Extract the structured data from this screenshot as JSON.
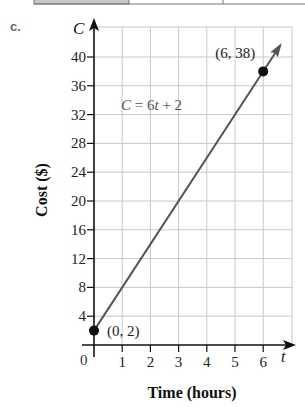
{
  "part_label": "c.",
  "top_table": {
    "visible": "partial",
    "shaded_cell_color": "#c8c8c8"
  },
  "chart_data": {
    "type": "line",
    "title": "",
    "xlabel": "Time (hours)",
    "ylabel": "Cost ($)",
    "x_axis_variable": "t",
    "y_axis_variable": "C",
    "origin_label": "0",
    "xlim": [
      0,
      6.5
    ],
    "ylim": [
      0,
      42
    ],
    "x_ticks": [
      1,
      2,
      3,
      4,
      5,
      6
    ],
    "x_tick_labels": [
      "1",
      "2",
      "3",
      "4",
      "5",
      "6"
    ],
    "y_ticks": [
      4,
      8,
      12,
      16,
      20,
      24,
      28,
      32,
      36,
      40
    ],
    "y_tick_labels": [
      "4",
      "8",
      "12",
      "16",
      "20",
      "24",
      "28",
      "32",
      "36",
      "40"
    ],
    "grid": true,
    "equation_label": "C = 6t + 2",
    "series": [
      {
        "name": "C = 6t + 2",
        "x": [
          0,
          6
        ],
        "y": [
          2,
          38
        ],
        "color": "#555555",
        "arrow_end": true
      }
    ],
    "points": [
      {
        "x": 0,
        "y": 2,
        "label": "(0, 2)"
      },
      {
        "x": 6,
        "y": 38,
        "label": "(6, 38)"
      }
    ]
  },
  "colors": {
    "axis": "#111111",
    "grid": "#c8c8c8",
    "line": "#555555",
    "point": "#111111",
    "label_gray": "#555555"
  }
}
